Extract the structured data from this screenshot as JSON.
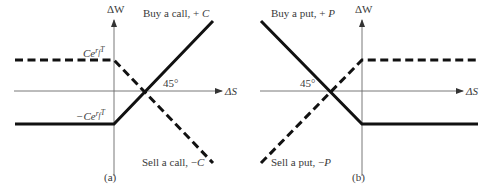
{
  "figure": {
    "panel_a": {
      "caption": "(a)",
      "y_axis_label": "ΔW",
      "x_axis_label": "ΔS",
      "angle_label": "45°",
      "upper_level_label_base": "Ce",
      "upper_level_label_exp": "r",
      "upper_level_label_exp_sub": "f",
      "upper_level_label_exp_tail": "T",
      "lower_level_label_base": "−Ce",
      "lower_level_label_exp": "r",
      "lower_level_label_exp_sub": "f",
      "lower_level_label_exp_tail": "T",
      "solid_line_label_text": "Buy a call, + ",
      "solid_line_label_var": "C",
      "dashed_line_label_text": "Sell a call, −",
      "dashed_line_label_var": "C"
    },
    "panel_b": {
      "caption": "(b)",
      "y_axis_label": "ΔW",
      "x_axis_label": "ΔS",
      "angle_label": "45°",
      "solid_line_label_text": "Buy a put, + ",
      "solid_line_label_var": "P",
      "dashed_line_label_text": "Sell a put, −",
      "dashed_line_label_var": "P"
    },
    "colors": {
      "line": "#111111",
      "axis": "#6a6a6a",
      "text": "#3a3a3a"
    }
  }
}
